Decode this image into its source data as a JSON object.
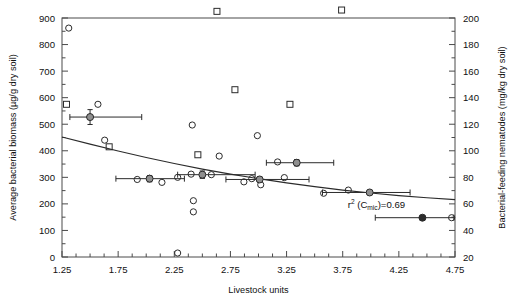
{
  "chart_data": {
    "type": "scatter",
    "title": "",
    "xlabel": "Livestock units",
    "ylabel": "Average bacterial biomass (µg/g dry soil)",
    "y2label": "Bacterial-feeding nematodes (mg/kg dry soil)",
    "xlim": [
      1.25,
      4.75
    ],
    "ylim": [
      0,
      900
    ],
    "y2lim": [
      20,
      200
    ],
    "xticks": [
      1.25,
      1.75,
      2.25,
      2.75,
      3.25,
      3.75,
      4.25,
      4.75
    ],
    "xtick_labels": [
      "1.25",
      "1.75",
      "2.25",
      "2.75",
      "3.25",
      "3.75",
      "4.25",
      "4.75"
    ],
    "x_minor_step": 0.125,
    "yticks": [
      0,
      100,
      200,
      300,
      400,
      500,
      600,
      700,
      800,
      900
    ],
    "ytick_labels": [
      "0",
      "100",
      "200",
      "300",
      "400",
      "500",
      "600",
      "700",
      "800",
      "900"
    ],
    "y2ticks": [
      20,
      40,
      60,
      80,
      100,
      120,
      140,
      160,
      180,
      200
    ],
    "y2tick_labels": [
      "20",
      "40",
      "60",
      "80",
      "100",
      "120",
      "140",
      "160",
      "180",
      "200"
    ],
    "grid": false,
    "legend": "none",
    "annotations": [
      {
        "text_main": "r",
        "text_sup": "2",
        "text_mid": " (C",
        "text_sub": "mic",
        "text_end": ")=0.69",
        "x": 4.05,
        "y": 185
      }
    ],
    "series": [
      {
        "name": "Average bacterial biomass",
        "marker": "open-circle",
        "axis": "left",
        "points": [
          {
            "x": 1.31,
            "y": 862
          },
          {
            "x": 1.5,
            "y": 527
          },
          {
            "x": 1.57,
            "y": 575
          },
          {
            "x": 1.63,
            "y": 440
          },
          {
            "x": 1.92,
            "y": 292
          },
          {
            "x": 2.03,
            "y": 296
          },
          {
            "x": 2.14,
            "y": 281
          },
          {
            "x": 2.28,
            "y": 300
          },
          {
            "x": 2.28,
            "y": 15
          },
          {
            "x": 2.4,
            "y": 312
          },
          {
            "x": 2.41,
            "y": 497
          },
          {
            "x": 2.42,
            "y": 212
          },
          {
            "x": 2.42,
            "y": 170
          },
          {
            "x": 2.58,
            "y": 310
          },
          {
            "x": 2.65,
            "y": 380
          },
          {
            "x": 2.87,
            "y": 283
          },
          {
            "x": 2.94,
            "y": 295
          },
          {
            "x": 2.99,
            "y": 457
          },
          {
            "x": 3.02,
            "y": 272
          },
          {
            "x": 3.17,
            "y": 358
          },
          {
            "x": 3.23,
            "y": 299
          },
          {
            "x": 3.34,
            "y": 354
          },
          {
            "x": 3.58,
            "y": 240
          },
          {
            "x": 3.8,
            "y": 252
          },
          {
            "x": 4.72,
            "y": 148
          }
        ]
      },
      {
        "name": "Bacterial-feeding nematodes",
        "marker": "open-square",
        "axis": "right",
        "points": [
          {
            "x": 1.29,
            "y": 135
          },
          {
            "x": 1.5,
            "y": 367
          },
          {
            "x": 1.67,
            "y": 103
          },
          {
            "x": 1.96,
            "y": 252
          },
          {
            "x": 2.07,
            "y": 248
          },
          {
            "x": 2.18,
            "y": 238
          },
          {
            "x": 2.3,
            "y": 345
          },
          {
            "x": 2.43,
            "y": 256
          },
          {
            "x": 2.46,
            "y": 97
          },
          {
            "x": 2.63,
            "y": 205
          },
          {
            "x": 2.73,
            "y": 497
          },
          {
            "x": 2.79,
            "y": 146
          },
          {
            "x": 3.06,
            "y": 263
          },
          {
            "x": 3.17,
            "y": 228
          },
          {
            "x": 3.28,
            "y": 135
          },
          {
            "x": 3.33,
            "y": 374
          },
          {
            "x": 3.5,
            "y": 257
          },
          {
            "x": 3.53,
            "y": 228
          },
          {
            "x": 3.74,
            "y": 206
          },
          {
            "x": 4.6,
            "y": 253
          }
        ]
      },
      {
        "name": "Group means (bacterial biomass)",
        "marker": "gray-circle-errorbar",
        "axis": "left",
        "points": [
          {
            "x": 1.5,
            "y": 527,
            "xerr_low": 0.18,
            "xerr_high": 0.46,
            "yerr": 28
          },
          {
            "x": 2.03,
            "y": 295,
            "xerr_low": 0.3,
            "xerr_high": 0.31,
            "yerr": 12
          },
          {
            "x": 2.5,
            "y": 310,
            "xerr_low": 0.22,
            "xerr_high": 0.47,
            "yerr": 14
          },
          {
            "x": 3.01,
            "y": 292,
            "xerr_low": 0.3,
            "xerr_high": 0.44,
            "yerr": 10
          },
          {
            "x": 3.34,
            "y": 355,
            "xerr_low": 0.27,
            "xerr_high": 0.33,
            "yerr": 12
          },
          {
            "x": 3.99,
            "y": 243,
            "xerr_low": 0.42,
            "xerr_high": 0.36,
            "yerr": 0
          }
        ]
      },
      {
        "name": "Group mean (nematodes)",
        "marker": "black-circle-errorbar",
        "axis": "left",
        "points": [
          {
            "x": 4.46,
            "y": 148,
            "xerr_low": 0.42,
            "xerr_high": 0.28,
            "yerr": 0
          }
        ]
      }
    ],
    "fit_curve": {
      "name": "regression",
      "style": "solid",
      "points": [
        {
          "x": 1.25,
          "y": 452
        },
        {
          "x": 1.5,
          "y": 425
        },
        {
          "x": 1.75,
          "y": 399
        },
        {
          "x": 2.0,
          "y": 375
        },
        {
          "x": 2.25,
          "y": 352
        },
        {
          "x": 2.5,
          "y": 331
        },
        {
          "x": 2.75,
          "y": 312
        },
        {
          "x": 3.0,
          "y": 295
        },
        {
          "x": 3.25,
          "y": 279
        },
        {
          "x": 3.5,
          "y": 265
        },
        {
          "x": 3.75,
          "y": 252
        },
        {
          "x": 4.0,
          "y": 241
        },
        {
          "x": 4.25,
          "y": 231
        },
        {
          "x": 4.5,
          "y": 223
        },
        {
          "x": 4.75,
          "y": 216
        }
      ]
    }
  }
}
